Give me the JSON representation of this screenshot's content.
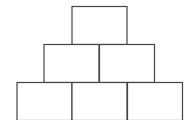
{
  "diagram": {
    "type": "block-pyramid",
    "rows": 3,
    "stroke_color": "#444444",
    "fill_color": "#ffffff",
    "rows_detail": [
      {
        "row": 1,
        "blocks": 1
      },
      {
        "row": 2,
        "blocks": 2
      },
      {
        "row": 3,
        "blocks": 3
      }
    ]
  }
}
